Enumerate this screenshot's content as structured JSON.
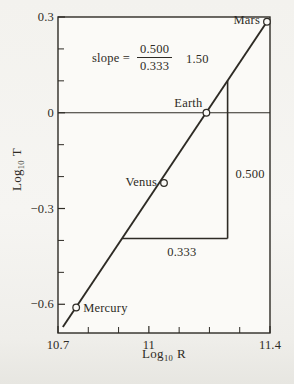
{
  "figure": {
    "background": "#f3f2ee",
    "plot_background": "#fbfaf7",
    "ink": "#2e2b25"
  },
  "chart_data": {
    "type": "scatter",
    "title": "",
    "xlabel": {
      "prefix": "Log",
      "sub": "10",
      "suffix": "R"
    },
    "ylabel": {
      "prefix": "Log",
      "sub": "10",
      "suffix": "T"
    },
    "xlim": [
      10.7,
      11.4
    ],
    "ylim": [
      -0.69,
      0.3
    ],
    "grid": "off",
    "x_ticks_labeled": [
      {
        "value": 10.7,
        "label": "10.7"
      },
      {
        "value": 11.0,
        "label": "11"
      },
      {
        "value": 11.4,
        "label": "11.4"
      }
    ],
    "x_ticks_minor": [
      10.8,
      10.9,
      11.1,
      11.2,
      11.3
    ],
    "y_ticks_labeled": [
      {
        "value": 0.3,
        "label": "0.3"
      },
      {
        "value": 0.0,
        "label": "0"
      },
      {
        "value": -0.3,
        "label": "−0.3"
      },
      {
        "value": -0.6,
        "label": "−0.6"
      }
    ],
    "y_ticks_minor": [
      0.2,
      0.1,
      -0.1,
      -0.2,
      -0.4,
      -0.5
    ],
    "zero_line_y": 0,
    "points": [
      {
        "name": "Mercury",
        "x": 10.76,
        "y": -0.61,
        "label_side": "right",
        "label_dx": 7,
        "label_dy": 1
      },
      {
        "name": "Venus",
        "x": 11.05,
        "y": -0.22,
        "label_side": "left",
        "label_dx": -7,
        "label_dy": -1
      },
      {
        "name": "Earth",
        "x": 11.19,
        "y": 0.0,
        "label_side": "left",
        "label_dx": -4,
        "label_dy": -10
      },
      {
        "name": "Mars",
        "x": 11.39,
        "y": 0.285,
        "label_side": "left",
        "label_dx": -7,
        "label_dy": -2
      }
    ],
    "fit_line": {
      "x1": 10.716,
      "y1": -0.671,
      "x2": 11.39,
      "y2": 0.285,
      "slope": 1.5
    },
    "slope_triangle": {
      "corner_x": 11.26,
      "base_y": -0.394,
      "rise_label": "0.500",
      "run_label": "0.333"
    },
    "annotation": {
      "prefix": "slope =",
      "numerator": "0.500",
      "denominator": "0.333",
      "result": "1.50"
    }
  }
}
